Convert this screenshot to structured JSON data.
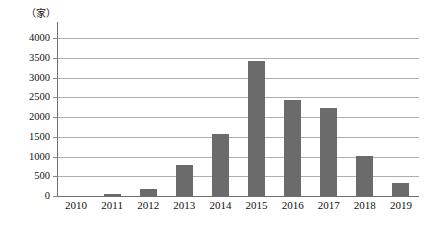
{
  "chart_data": {
    "type": "bar",
    "title": "",
    "subtitle": "",
    "xlabel": "",
    "ylabel": "",
    "unit_label": "（家）",
    "categories": [
      "2010",
      "2011",
      "2012",
      "2013",
      "2014",
      "2015",
      "2016",
      "2017",
      "2018",
      "2019"
    ],
    "values": [
      0,
      40,
      190,
      790,
      1560,
      3420,
      2440,
      2220,
      1010,
      340
    ],
    "ylim": [
      0,
      4000
    ],
    "ytick_labels": [
      "4000",
      "3500",
      "3000",
      "2500",
      "2000",
      "1500",
      "1000",
      "500",
      "0"
    ],
    "ytick_values": [
      4000,
      3500,
      3000,
      2500,
      2000,
      1500,
      1000,
      500,
      0
    ],
    "grid": true,
    "legend": null,
    "legend_position": "none",
    "series": [
      {
        "name": "",
        "values": [
          0,
          40,
          190,
          790,
          1560,
          3420,
          2440,
          2220,
          1010,
          340
        ]
      }
    ],
    "colors": {
      "bar": "#6b6b6b",
      "gridline": "#aeaeae",
      "axis": "#6e6e6e",
      "text": "#111111",
      "background": "#ffffff"
    }
  }
}
